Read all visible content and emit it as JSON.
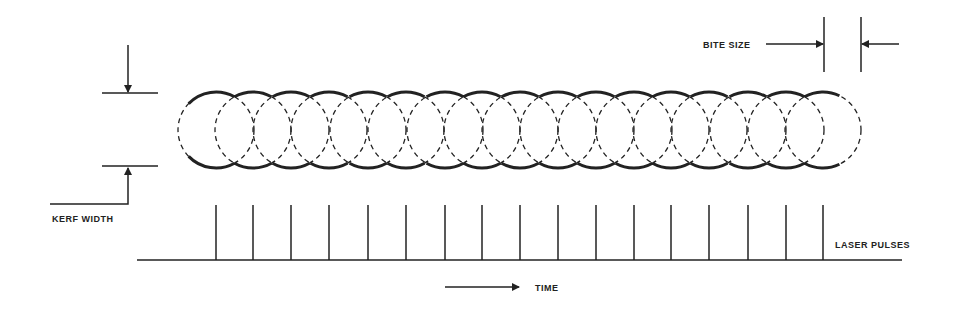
{
  "labels": {
    "bite_size": "BITE SIZE",
    "kerf_width": "KERF WIDTH",
    "laser_pulses": "LASER PULSES",
    "time": "TIME"
  },
  "geometry": {
    "pulse_x": [
      216,
      253,
      291,
      329,
      368,
      406,
      445,
      482,
      520,
      558,
      596,
      634,
      671,
      709,
      748,
      786,
      823
    ],
    "circle_center_y": 130,
    "circle_radius": 38,
    "baseline_y": 260,
    "baseline_x": [
      137,
      902
    ],
    "pulse_top_y": 205
  },
  "colors": {
    "ink": "#222222",
    "background": "#ffffff"
  }
}
